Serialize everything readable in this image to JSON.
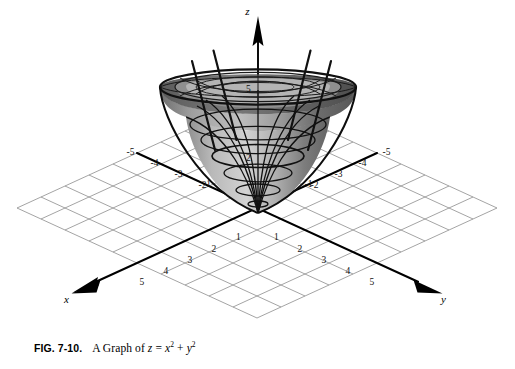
{
  "figure": {
    "title_label": "FIG. 7-10.",
    "caption_prefix": "A Graph of",
    "equation_plain": "z = x2 + y2",
    "equation_parts": {
      "lhs": "z",
      "eq": "=",
      "term1_base": "x",
      "term1_exp": "2",
      "plus": "+",
      "term2_base": "y",
      "term2_exp": "2"
    }
  },
  "axes": {
    "z_label": "z",
    "x_label": "x",
    "y_label": "y",
    "x_negative_ticks": [
      "-1",
      "-2",
      "-3",
      "-4",
      "-5"
    ],
    "x_positive_ticks": [
      "1",
      "2",
      "3",
      "4",
      "5"
    ],
    "y_negative_ticks": [
      "-1",
      "-2",
      "-3",
      "-4",
      "-5"
    ],
    "y_positive_ticks": [
      "1",
      "2",
      "3",
      "4",
      "5"
    ],
    "z_ticks": [
      "2",
      "5"
    ]
  },
  "surface": {
    "name": "paraboloid-z-equals-x-squared-plus-y-squared",
    "fill_light": "#cfcfcf",
    "fill_mid": "#9a9a9a",
    "fill_dark": "#5e5e5e",
    "rim_fill": "#6a6a6a",
    "mesh_color": "#1a1a1a"
  },
  "grid": {
    "line_color": "#8a8a8a",
    "axis_color": "#000000",
    "divisions": 10
  }
}
